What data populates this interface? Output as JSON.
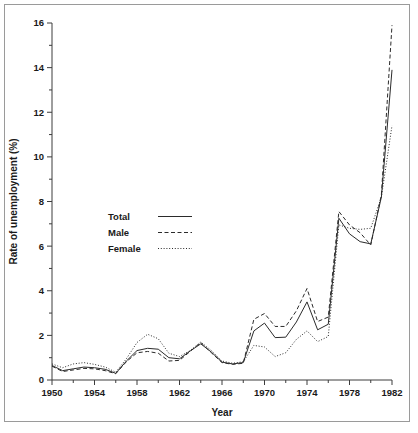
{
  "figure": {
    "background": "#ffffff",
    "frame_color": "#9a9a9a",
    "ink_color": "#2b2b2b"
  },
  "axes": {
    "x_title": "Year",
    "y_title": "Rate of unemployment (%)",
    "x_major_ticks": [
      "1950",
      "1954",
      "1958",
      "1962",
      "1966",
      "1970",
      "1974",
      "1978",
      "1982"
    ],
    "x_minor_ticks": [
      "1952",
      "1956",
      "1960",
      "1964",
      "1968",
      "1972",
      "1976",
      "1980"
    ],
    "y_major_ticks": [
      "0",
      "2",
      "4",
      "6",
      "8",
      "10",
      "12",
      "14",
      "16"
    ],
    "y_minor_ticks": [
      "1",
      "3",
      "5",
      "7",
      "9",
      "11",
      "13",
      "15"
    ]
  },
  "legend": {
    "position": "inside-left-middle",
    "entries": [
      {
        "label": "Total",
        "style": "solid"
      },
      {
        "label": "Male",
        "style": "dashed"
      },
      {
        "label": "Female",
        "style": "dotted"
      }
    ]
  },
  "chart_data": {
    "type": "line",
    "title": "",
    "subtitle": "",
    "xlabel": "Year",
    "ylabel": "Rate of unemployment (%)",
    "xlim": [
      1950,
      1982
    ],
    "ylim": [
      0,
      16
    ],
    "grid": false,
    "legend_position": "inside-left-middle",
    "x": [
      1950,
      1951,
      1952,
      1953,
      1954,
      1955,
      1956,
      1957,
      1958,
      1959,
      1960,
      1961,
      1962,
      1963,
      1964,
      1965,
      1966,
      1967,
      1968,
      1969,
      1970,
      1971,
      1972,
      1973,
      1974,
      1975,
      1976,
      1977,
      1978,
      1979,
      1980,
      1981,
      1982
    ],
    "series": [
      {
        "name": "Total",
        "style": "solid",
        "values": [
          0.65,
          0.42,
          0.5,
          0.58,
          0.55,
          0.48,
          0.3,
          0.85,
          1.32,
          1.42,
          1.38,
          1.0,
          0.95,
          1.3,
          1.62,
          1.25,
          0.8,
          0.72,
          0.78,
          2.2,
          2.55,
          1.9,
          1.92,
          2.6,
          3.5,
          2.25,
          2.5,
          7.25,
          6.55,
          6.2,
          6.1,
          8.2,
          13.9
        ]
      },
      {
        "name": "Male",
        "style": "dashed",
        "values": [
          0.62,
          0.38,
          0.45,
          0.52,
          0.5,
          0.42,
          0.28,
          0.82,
          1.22,
          1.28,
          1.2,
          0.85,
          0.88,
          1.28,
          1.68,
          1.22,
          0.78,
          0.7,
          0.75,
          2.72,
          2.98,
          2.4,
          2.4,
          3.1,
          4.1,
          2.62,
          2.82,
          7.55,
          6.95,
          6.6,
          6.05,
          8.3,
          15.9
        ]
      },
      {
        "name": "Female",
        "style": "dotted",
        "values": [
          0.72,
          0.55,
          0.72,
          0.78,
          0.7,
          0.58,
          0.35,
          0.95,
          1.68,
          2.05,
          1.85,
          1.2,
          1.05,
          1.32,
          1.7,
          1.32,
          0.85,
          0.75,
          0.82,
          1.55,
          1.48,
          1.05,
          1.22,
          1.82,
          2.2,
          1.72,
          1.95,
          6.95,
          6.8,
          6.75,
          6.8,
          8.2,
          11.4
        ]
      }
    ]
  }
}
